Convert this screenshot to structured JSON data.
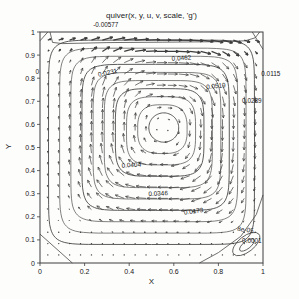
{
  "chart_data": {
    "type": "quiver",
    "title": "quiver(x, y, u, v, scale, 'g')",
    "xlabel": "X",
    "ylabel": "Y",
    "xlim": [
      0,
      1
    ],
    "ylim": [
      0,
      1
    ],
    "grid": false,
    "x_ticks": [
      0,
      0.2,
      0.4,
      0.6,
      0.8,
      1
    ],
    "x_tick_labels": [
      "0",
      "0.2",
      "0.4",
      "0.6",
      "0.8",
      "1"
    ],
    "y_ticks": [
      0,
      0.1,
      0.2,
      0.3,
      0.4,
      0.5,
      0.6,
      0.7,
      0.8,
      0.9,
      1
    ],
    "y_tick_labels": [
      "0",
      "0.1",
      "0.2",
      "0.3",
      "0.4",
      "0.5",
      "0.6",
      "0.7",
      "0.8",
      "0.9",
      "1"
    ],
    "line_color": "#4a4a4a",
    "arrow_color": "#3c3c3c",
    "text_color": "#171717",
    "axis_color": "#3d3d3d",
    "contour_level_step": 0.00577,
    "contour_labels": [
      {
        "text": "-0.00577",
        "x": 0.295,
        "y": 1.02,
        "rot": 0
      },
      {
        "text": "0",
        "x": -0.012,
        "y": 0.82,
        "rot": 0
      },
      {
        "text": "0.0231",
        "x": 0.305,
        "y": 0.815,
        "rot": -12
      },
      {
        "text": "0.0462",
        "x": 0.635,
        "y": 0.878,
        "rot": -4
      },
      {
        "text": "0.0519",
        "x": 0.79,
        "y": 0.757,
        "rot": -6
      },
      {
        "text": "0.0115",
        "x": 1.035,
        "y": 0.81,
        "rot": 0
      },
      {
        "text": "0.0289",
        "x": 0.95,
        "y": 0.692,
        "rot": 0
      },
      {
        "text": "0.0404",
        "x": 0.41,
        "y": 0.415,
        "rot": -3
      },
      {
        "text": "0.0346",
        "x": 0.53,
        "y": 0.292,
        "rot": -2
      },
      {
        "text": "0.0173",
        "x": 0.69,
        "y": 0.215,
        "rot": -8
      },
      {
        "text": "8e-05",
        "x": 0.92,
        "y": 0.135,
        "rot": 8
      },
      {
        "text": "0.0001",
        "x": 0.95,
        "y": 0.088,
        "rot": 0
      }
    ],
    "vortex": {
      "cx": 0.555,
      "cy": 0.585,
      "rotation": "clockwise"
    },
    "rings": {
      "count": 10,
      "outer": {
        "cx": 0.5,
        "cy": 0.525,
        "a": 0.462,
        "bu": 0.44,
        "bd": 0.445,
        "p": 10
      },
      "inner": {
        "cx": 0.555,
        "cy": 0.585,
        "a": 0.067,
        "bu": 0.065,
        "bd": 0.062,
        "p": 2
      }
    },
    "lid_contour": [
      [
        0.045,
        1.0
      ],
      [
        0.056,
        0.955
      ],
      [
        0.1,
        0.95
      ],
      [
        0.3,
        0.954
      ],
      [
        0.55,
        0.956
      ],
      [
        0.8,
        0.958
      ],
      [
        0.92,
        0.962
      ],
      [
        0.965,
        0.975
      ],
      [
        0.985,
        1.0
      ]
    ],
    "corner_lines": [
      [
        [
          0,
          0.125
        ],
        [
          0.145,
          0
        ]
      ],
      [
        [
          0,
          0.962
        ],
        [
          0.035,
          1
        ]
      ],
      [
        [
          0.952,
          1
        ],
        [
          1,
          0.925
        ]
      ]
    ],
    "br_separatrix": [
      [
        0.715,
        0
      ],
      [
        0.8,
        0.045
      ],
      [
        0.9,
        0.115
      ],
      [
        0.97,
        0.21
      ],
      [
        1,
        0.295
      ]
    ],
    "br_ellipses": [
      {
        "cx": 0.925,
        "cy": 0.082,
        "rx": 0.072,
        "ry": 0.034,
        "rot": -38
      },
      {
        "cx": 0.928,
        "cy": 0.078,
        "rx": 0.04,
        "ry": 0.016,
        "rot": -38
      }
    ],
    "quiver": {
      "nx": 20,
      "ny": 20,
      "x0": 0.035,
      "x1": 0.965,
      "y0": 0.035,
      "y1": 0.965,
      "max_len_px": 10,
      "lid_y": 0.9,
      "lid_boost_px": 9,
      "norm_a": 0.5,
      "norm_b": 0.52,
      "p": 3
    },
    "plot_box": {
      "left": 40,
      "top": 32,
      "right": 263,
      "bottom": 263
    }
  }
}
